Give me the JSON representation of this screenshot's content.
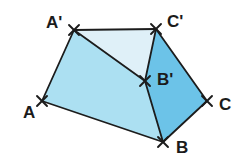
{
  "figure": {
    "kind": "geometry-diagram",
    "background_color": "#ffffff",
    "stroke_color": "#1c1c1c",
    "stroke_width": 1.8,
    "tick_color": "#1c1c1c",
    "region_colors": {
      "light": "#dff0f8",
      "medium": "#ace0f2",
      "dark": "#6cc3e8"
    },
    "points": [
      {
        "id": "A",
        "label": "A",
        "x": 42,
        "y": 101,
        "label_x": 23,
        "label_y": 104
      },
      {
        "id": "Ap",
        "label": "A'",
        "x": 74,
        "y": 30,
        "label_x": 46,
        "label_y": 14
      },
      {
        "id": "Cp",
        "label": "C'",
        "x": 156,
        "y": 29,
        "label_x": 167,
        "label_y": 13
      },
      {
        "id": "Bp",
        "label": "B'",
        "x": 145,
        "y": 81,
        "label_x": 157,
        "label_y": 71
      },
      {
        "id": "C",
        "label": "C",
        "x": 207,
        "y": 101,
        "label_x": 219,
        "label_y": 96
      },
      {
        "id": "B",
        "label": "B",
        "x": 163,
        "y": 142,
        "label_x": 176,
        "label_y": 139
      }
    ],
    "regions": [
      {
        "id": "triangle-ap-bp-cp",
        "name": "triangle A' B' C'",
        "fill": "#dff0f8",
        "vertices": [
          "Ap",
          "Cp",
          "Bp"
        ]
      },
      {
        "id": "quad-a-ap-bp-b",
        "name": "quadrilateral A A' B' B",
        "fill": "#ace0f2",
        "vertices": [
          "A",
          "Ap",
          "Bp",
          "B"
        ]
      },
      {
        "id": "quad-bp-cp-c-b",
        "name": "quadrilateral B' C' C B",
        "fill": "#6cc3e8",
        "vertices": [
          "Bp",
          "Cp",
          "C",
          "B"
        ]
      }
    ],
    "segments": [
      {
        "id": "seg-a-ap",
        "from": "A",
        "to": "Ap",
        "name": "segment-A-Aprime"
      },
      {
        "id": "seg-ap-cp",
        "from": "Ap",
        "to": "Cp",
        "name": "segment-Aprime-Cprime"
      },
      {
        "id": "seg-cp-c",
        "from": "Cp",
        "to": "C",
        "name": "segment-Cprime-C"
      },
      {
        "id": "seg-c-b",
        "from": "C",
        "to": "B",
        "name": "segment-C-B"
      },
      {
        "id": "seg-b-a",
        "from": "B",
        "to": "A",
        "name": "segment-B-A"
      },
      {
        "id": "seg-ap-bp",
        "from": "Ap",
        "to": "Bp",
        "name": "segment-Aprime-Bprime"
      },
      {
        "id": "seg-bp-cp",
        "from": "Bp",
        "to": "Cp",
        "name": "segment-Bprime-Cprime"
      },
      {
        "id": "seg-bp-b",
        "from": "Bp",
        "to": "B",
        "name": "segment-Bprime-B"
      }
    ],
    "tick_marks": {
      "style": "x-cross",
      "arm_length": 7,
      "points": [
        "A",
        "Ap",
        "Cp",
        "Bp",
        "C",
        "B"
      ]
    }
  }
}
